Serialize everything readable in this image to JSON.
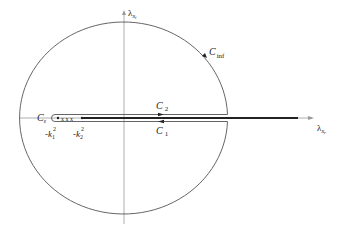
{
  "diagram": {
    "type": "contour-integration-complex-plane",
    "axes": {
      "vertical_label": "λ",
      "vertical_subscript": "x",
      "vertical_subsub": "i",
      "horizontal_label": "λ",
      "horizontal_subscript": "x",
      "horizontal_subsub": "r"
    },
    "contours": {
      "outer": {
        "name": "C",
        "sub": "inf"
      },
      "upper": {
        "name": "C",
        "sub": "2"
      },
      "lower": {
        "name": "C",
        "sub": "1"
      },
      "small": {
        "name": "C",
        "sub": "ε"
      }
    },
    "points": [
      {
        "label": "-k",
        "sup": "2",
        "sub": "1"
      },
      {
        "label": "-k",
        "sup": "2",
        "sub": "2"
      }
    ],
    "poles_marker": "x x x",
    "colors": {
      "line": "#555555",
      "branch_cut": "#222222",
      "axis": "#999999"
    }
  }
}
